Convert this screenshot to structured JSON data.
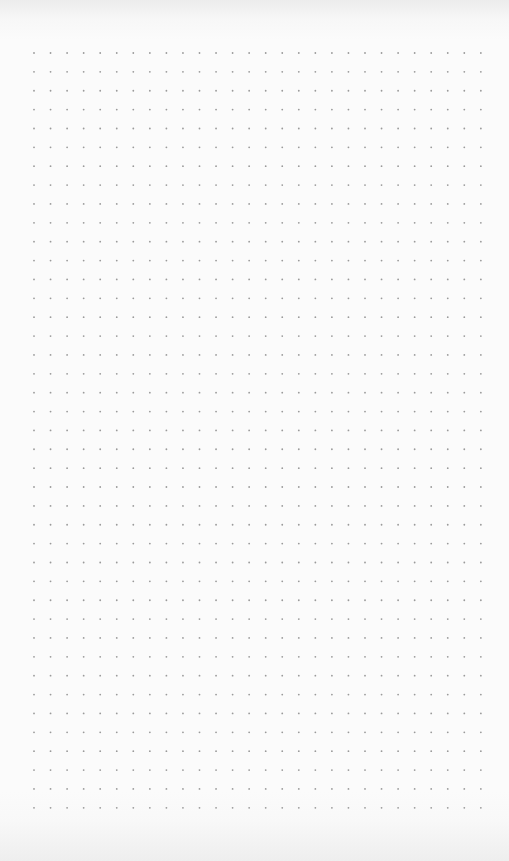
{
  "page": {
    "type": "dot-grid-paper",
    "background_color": "#fbfbfb",
    "dot_color": "#9a9a9a",
    "grid": {
      "columns": 28,
      "rows": 41,
      "origin_x": 34,
      "origin_y": 53,
      "spacing_x": 16.55,
      "spacing_y": 18.87,
      "dot_radius": 0.9
    }
  }
}
